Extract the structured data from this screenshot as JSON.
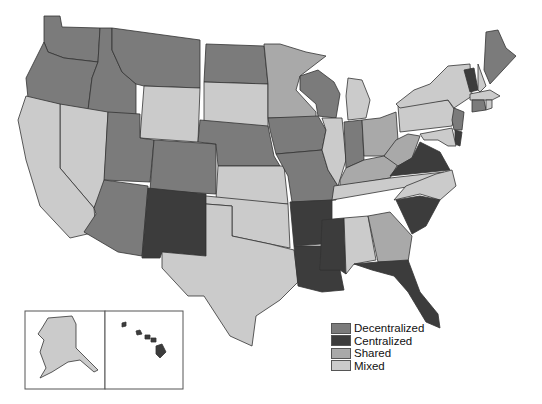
{
  "categories": {
    "Decentralized": "#7b7b7b",
    "Centralized": "#3c3c3c",
    "Shared": "#a9a9a9",
    "Mixed": "#cbcbcb"
  },
  "legend": [
    {
      "label": "Decentralized",
      "category": "Decentralized"
    },
    {
      "label": "Centralized",
      "category": "Centralized"
    },
    {
      "label": "Shared",
      "category": "Shared"
    },
    {
      "label": "Mixed",
      "category": "Mixed"
    }
  ],
  "states": {
    "WA": "Decentralized",
    "OR": "Decentralized",
    "ID": "Decentralized",
    "MT": "Decentralized",
    "WY": "Mixed",
    "CA": "Mixed",
    "NV": "Mixed",
    "UT": "Decentralized",
    "AZ": "Decentralized",
    "CO": "Decentralized",
    "NM": "Centralized",
    "ND": "Decentralized",
    "SD": "Mixed",
    "NE": "Decentralized",
    "KS": "Mixed",
    "OK": "Mixed",
    "TX": "Mixed",
    "MN": "Shared",
    "IA": "Decentralized",
    "MO": "Decentralized",
    "AR": "Centralized",
    "LA": "Centralized",
    "WI": "Decentralized",
    "IL": "Mixed",
    "MI": "Mixed",
    "IN": "Decentralized",
    "OH": "Shared",
    "KY": "Shared",
    "TN": "Mixed",
    "MS": "Centralized",
    "AL": "Mixed",
    "GA": "Shared",
    "FL": "Centralized",
    "SC": "Centralized",
    "NC": "Mixed",
    "VA": "Centralized",
    "WV": "Shared",
    "PA": "Mixed",
    "NY": "Mixed",
    "VT": "Centralized",
    "NH": "Mixed",
    "ME": "Decentralized",
    "MA": "Mixed",
    "CT": "Decentralized",
    "RI": "Mixed",
    "NJ": "Decentralized",
    "DE": "Centralized",
    "MD": "Mixed",
    "AK": "Mixed",
    "HI": "Centralized"
  }
}
